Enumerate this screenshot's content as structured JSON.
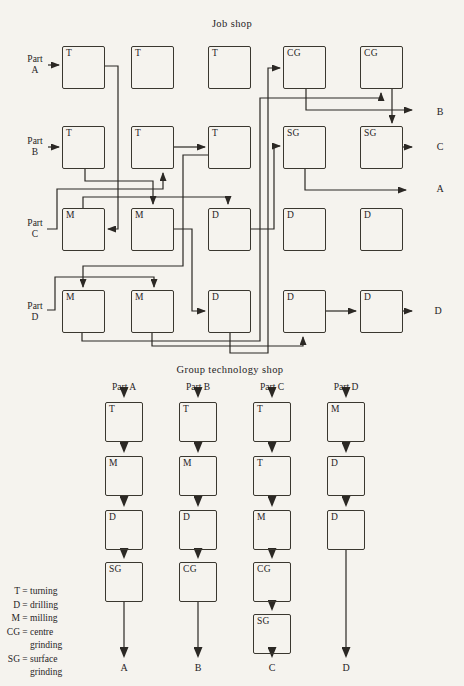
{
  "page": {
    "background": "#f5f3ee",
    "ink": "#2b2824"
  },
  "job_shop": {
    "title": "Job shop",
    "machine_grid": [
      [
        "T",
        "T",
        "T",
        "CG",
        "CG"
      ],
      [
        "T",
        "T",
        "T",
        "SG",
        "SG"
      ],
      [
        "M",
        "M",
        "D",
        "D",
        "D"
      ],
      [
        "M",
        "M",
        "D",
        "D",
        "D"
      ]
    ],
    "parts_in": [
      {
        "word": "Part",
        "letter": "A"
      },
      {
        "word": "Part",
        "letter": "B"
      },
      {
        "word": "Part",
        "letter": "C"
      },
      {
        "word": "Part",
        "letter": "D"
      }
    ],
    "outputs": [
      "B",
      "C",
      "A",
      "D"
    ],
    "routes": [
      {
        "part": "A",
        "path": [
          "T(r1c1)",
          "M(r3c1)",
          "D(r3c3)",
          "SG(r2c4)"
        ],
        "exit": "A"
      },
      {
        "part": "B",
        "path": [
          "T(r2c1)",
          "M(r3c2)",
          "D(r4c3)",
          "CG(r1c4)"
        ],
        "exit": "B"
      },
      {
        "part": "C",
        "path": [
          "T(r2c2)",
          "T(r2c3)",
          "M(r4c1)",
          "CG(r1c5)",
          "SG(r2c5)"
        ],
        "exit": "C"
      },
      {
        "part": "D",
        "path": [
          "M(r4c2)",
          "D(r4c4)",
          "D(r4c5)"
        ],
        "exit": "D"
      }
    ]
  },
  "gt_shop": {
    "title": "Group technology shop",
    "columns": [
      {
        "part": "Part A",
        "sequence": [
          "T",
          "M",
          "D",
          "SG"
        ],
        "output": "A"
      },
      {
        "part": "Part B",
        "sequence": [
          "T",
          "M",
          "D",
          "CG"
        ],
        "output": "B"
      },
      {
        "part": "Part C",
        "sequence": [
          "T",
          "T",
          "M",
          "CG",
          "SG"
        ],
        "output": "C"
      },
      {
        "part": "Part D",
        "sequence": [
          "M",
          "D",
          "D"
        ],
        "output": "D"
      }
    ]
  },
  "legend": {
    "items": [
      {
        "abbr": "T",
        "def": "turning"
      },
      {
        "abbr": "D",
        "def": "drilling"
      },
      {
        "abbr": "M",
        "def": "milling"
      },
      {
        "abbr": "CG",
        "def": "centre grinding"
      },
      {
        "abbr": "SG",
        "def": "surface grinding"
      }
    ]
  }
}
